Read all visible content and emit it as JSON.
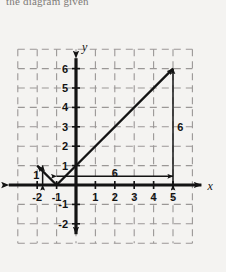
{
  "header": {
    "clipped_text": "the diagram given"
  },
  "chart_data": {
    "type": "line",
    "title": "",
    "xlabel": "x",
    "ylabel": "y",
    "xlim": [
      -3,
      6
    ],
    "ylim": [
      -3,
      7
    ],
    "grid": true,
    "grid_style": "dashed",
    "x_ticks": [
      -2,
      -1,
      1,
      2,
      3,
      4,
      5
    ],
    "y_ticks": [
      6,
      5,
      4,
      3,
      2,
      1,
      -1,
      -2
    ],
    "x_tick_labels": [
      "-2",
      "-1",
      "1",
      "2",
      "3",
      "4",
      "5"
    ],
    "y_tick_labels": [
      "6",
      "5",
      "4",
      "3",
      "2",
      "1",
      "-1",
      "-2"
    ],
    "series": [
      {
        "name": "absolute-value-graph",
        "type": "piecewise-linear",
        "points": [
          [
            -2,
            1
          ],
          [
            -1,
            0
          ],
          [
            5,
            6
          ]
        ],
        "left_ray_arrow": true,
        "right_ray_arrow": true
      }
    ],
    "annotations": [
      {
        "name": "rise-label",
        "label": "6",
        "orientation": "vertical",
        "at_x": 5,
        "from_y": 0,
        "to_y": 6,
        "label_x": 5.38,
        "label_y": 3
      },
      {
        "name": "run-label",
        "label": "6",
        "orientation": "horizontal",
        "at_y": 0.45,
        "from_x": -1,
        "to_x": 5,
        "label_x": 2,
        "label_y": 0.62
      },
      {
        "name": "left-rise-label",
        "label": "1",
        "orientation": "vertical",
        "at_x": -1.72,
        "from_y": 0,
        "to_y": 1,
        "label_x": -2.05,
        "label_y": 0.5
      }
    ]
  },
  "colors": {
    "background": "#f4f3f1",
    "grid": "#9a9796",
    "axis": "#131313",
    "curve": "#131313",
    "annotation": "#131313",
    "text": "#131313"
  }
}
